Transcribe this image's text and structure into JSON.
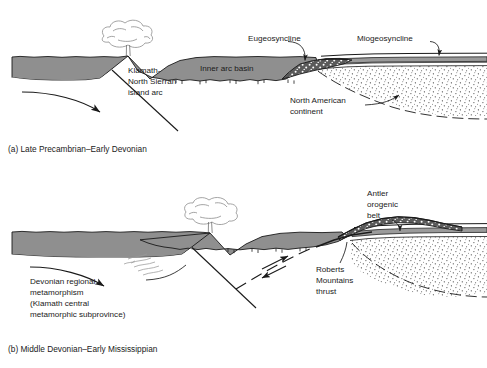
{
  "figure": {
    "type": "geologic-cross-section",
    "colors": {
      "crust_gray": "#8f8f8f",
      "eugeosyncline_dark": "#595959",
      "stipple_continent": "#ffffff",
      "line": "#1a1a1a",
      "background": "#ffffff"
    }
  },
  "panel_a": {
    "caption": "(a) Late Precambrian–Early Devonian",
    "labels": {
      "island_arc": [
        "Klamath-",
        "North Sierran",
        "island arc"
      ],
      "inner_arc_basin": "Inner arc basin",
      "eugeosyncline": "Eugeosyncline",
      "miogeosyncline": "Miogeosyncline",
      "continent": [
        "North American",
        "continent"
      ]
    }
  },
  "panel_b": {
    "caption": "(b) Middle Devonian–Early Mississippian",
    "labels": {
      "metamorphism": [
        "Devonian regional",
        "metamorphism",
        "(Klamath central",
        "metamorphic subprovince)"
      ],
      "antler": [
        "Antler",
        "orogenic",
        "belt"
      ],
      "roberts": [
        "Roberts",
        "Mountains",
        "thrust"
      ]
    }
  }
}
